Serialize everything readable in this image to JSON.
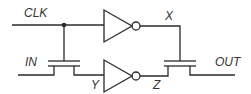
{
  "diagram": {
    "type": "circuit-schematic",
    "labels": {
      "clk": "CLK",
      "in": "IN",
      "x": "X",
      "y": "Y",
      "z": "Z",
      "out": "OUT"
    },
    "components": [
      {
        "id": "inv-top",
        "kind": "inverter",
        "input": "CLK",
        "output": "X"
      },
      {
        "id": "inv-bottom",
        "kind": "inverter",
        "input": "Y",
        "output": "Z"
      },
      {
        "id": "pass-left",
        "kind": "nmos-transistor",
        "gate": "CLK",
        "source": "IN",
        "drain": "Y"
      },
      {
        "id": "pass-right",
        "kind": "nmos-transistor",
        "gate": "X",
        "source": "Z",
        "drain": "OUT"
      }
    ],
    "colors": {
      "line": "#2a2a2a",
      "text": "#333333",
      "background": "#ffffff"
    }
  }
}
